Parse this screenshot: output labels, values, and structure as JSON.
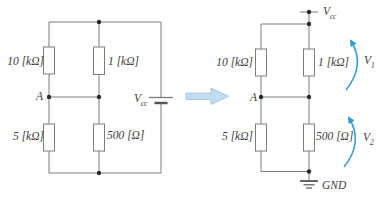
{
  "colors": {
    "wire": "#7d7d7d",
    "plate": "#555555",
    "text": "#3b3b3b",
    "node_dot": "#2a2a2a",
    "signal_arrow": "#2e9bd6",
    "transform_arrow_fill": "#c2dcf0",
    "transform_arrow_stroke": "#a3c8e4"
  },
  "left_circuit": {
    "r_top_left_label": "10 [kΩ]",
    "r_top_mid_label": "1 [kΩ]",
    "r_bottom_left_label": "5 [kΩ]",
    "r_bottom_mid_label": "500 [Ω]",
    "node_a_label": "A",
    "source_label": {
      "main": "V",
      "sub": "cc"
    }
  },
  "right_circuit": {
    "r_top_left_label": "10 [kΩ]",
    "r_top_right_label": "1 [kΩ]",
    "r_bottom_left_label": "5 [kΩ]",
    "r_bottom_right_label": "500 [Ω]",
    "node_a_label": "A",
    "vcc_label": {
      "main": "V",
      "sub": "cc"
    },
    "v1_label": {
      "main": "V",
      "sub": "1"
    },
    "v2_label": {
      "main": "V",
      "sub": "2"
    },
    "gnd_label": "GND"
  }
}
